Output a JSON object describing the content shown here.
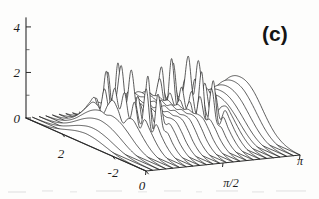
{
  "figure": {
    "panel_label": "(c)",
    "type": "3d-waterfall-ridge-plot",
    "ink_color": "#1c1c1c",
    "background_color": "#fdfdfc"
  },
  "axes": {
    "z_axis": {
      "name": "vertical-amplitude-axis",
      "ticks": [
        {
          "label": "0",
          "value": 0
        },
        {
          "label": "2",
          "value": 2
        },
        {
          "label": "4",
          "value": 4
        }
      ],
      "minor_ticks": [
        1,
        3
      ],
      "range": [
        0,
        4.4
      ]
    },
    "depth_axis": {
      "name": "left-depth-axis",
      "ticks": [
        {
          "label": "2",
          "value": 2
        },
        {
          "label": "-2",
          "value": -2
        },
        {
          "label": "0",
          "value": 0
        }
      ],
      "range": [
        4,
        -4
      ]
    },
    "time_axis": {
      "name": "bottom-right-phase-axis",
      "ticks": [
        {
          "label": "0",
          "value": 0
        },
        {
          "label": "π/2",
          "value": 1.5708
        },
        {
          "label": "π",
          "value": 3.1416
        }
      ],
      "range": [
        0,
        3.1416
      ]
    }
  },
  "chart_data": {
    "type": "line",
    "title": "",
    "subtitle": "",
    "xlabel": "",
    "ylabel": "",
    "zlabel": "",
    "grid": false,
    "legend": "none",
    "projection": {
      "origin_x": 26,
      "origin_y": 118,
      "x_unit_px": 88.0,
      "y_depth_dx": 30.0,
      "y_depth_dy": -27.0,
      "z_unit_px": 24.6
    },
    "xlim": [
      0,
      3.1416
    ],
    "ylim": [
      -4,
      4
    ],
    "zlim": [
      0,
      4.4
    ],
    "note": "Waterfall of 24 successive ridge traces; each trace is an oscillatory packet amplitude vs. a transverse coordinate, stacked along the phase axis.",
    "x": [
      -4.0,
      -3.6667,
      -3.3333,
      -3.0,
      -2.6667,
      -2.3333,
      -2.0,
      -1.6667,
      -1.3333,
      -1.0,
      -0.6667,
      -0.3333,
      0.0,
      0.3333,
      0.6667,
      1.0,
      1.3333,
      1.6667,
      2.0,
      2.3333,
      2.6667,
      3.0,
      3.3333,
      3.6667,
      4.0
    ],
    "series": [
      {
        "name": "trace-01",
        "phase": 0.0,
        "values": [
          0.0,
          0.0,
          0.01,
          0.02,
          0.04,
          0.07,
          0.12,
          0.18,
          0.25,
          0.32,
          0.38,
          0.42,
          0.44,
          0.42,
          0.38,
          0.32,
          0.25,
          0.18,
          0.12,
          0.07,
          0.04,
          0.02,
          0.01,
          0.0,
          0.0
        ]
      },
      {
        "name": "trace-02",
        "phase": 0.1368,
        "values": [
          0.0,
          0.01,
          0.02,
          0.04,
          0.07,
          0.12,
          0.19,
          0.28,
          0.38,
          0.48,
          0.56,
          0.62,
          0.64,
          0.62,
          0.56,
          0.48,
          0.38,
          0.28,
          0.19,
          0.12,
          0.07,
          0.04,
          0.02,
          0.01,
          0.0
        ]
      },
      {
        "name": "trace-03",
        "phase": 0.2736,
        "values": [
          0.0,
          0.01,
          0.03,
          0.06,
          0.11,
          0.19,
          0.3,
          0.44,
          0.59,
          0.73,
          0.84,
          0.91,
          0.94,
          0.91,
          0.84,
          0.73,
          0.59,
          0.44,
          0.3,
          0.19,
          0.11,
          0.06,
          0.03,
          0.01,
          0.0
        ]
      },
      {
        "name": "trace-04",
        "phase": 0.4104,
        "values": [
          0.0,
          0.02,
          0.05,
          0.1,
          0.18,
          0.3,
          0.46,
          0.66,
          0.86,
          1.03,
          1.14,
          1.18,
          1.12,
          1.18,
          1.14,
          1.03,
          0.86,
          0.66,
          0.46,
          0.3,
          0.18,
          0.1,
          0.05,
          0.02,
          0.0
        ]
      },
      {
        "name": "trace-05",
        "phase": 0.5472,
        "values": [
          0.01,
          0.03,
          0.07,
          0.15,
          0.28,
          0.47,
          0.72,
          1.0,
          1.25,
          1.2,
          0.95,
          1.4,
          1.68,
          1.4,
          0.95,
          1.2,
          1.25,
          1.0,
          0.72,
          0.47,
          0.28,
          0.15,
          0.07,
          0.03,
          0.01
        ]
      },
      {
        "name": "trace-06",
        "phase": 0.684,
        "values": [
          0.01,
          0.04,
          0.1,
          0.21,
          0.4,
          0.68,
          1.02,
          1.32,
          0.9,
          1.85,
          1.1,
          2.05,
          1.3,
          2.05,
          1.1,
          1.85,
          0.9,
          1.32,
          1.02,
          0.68,
          0.4,
          0.21,
          0.1,
          0.04,
          0.01
        ]
      },
      {
        "name": "trace-07",
        "phase": 0.8208,
        "values": [
          0.01,
          0.05,
          0.13,
          0.27,
          0.5,
          0.82,
          1.18,
          0.85,
          2.45,
          0.95,
          1.6,
          2.95,
          1.55,
          2.95,
          1.6,
          0.95,
          2.45,
          0.85,
          1.18,
          0.82,
          0.5,
          0.27,
          0.13,
          0.05,
          0.01
        ]
      },
      {
        "name": "trace-08",
        "phase": 0.9576,
        "values": [
          0.01,
          0.05,
          0.14,
          0.29,
          0.54,
          0.88,
          1.05,
          2.3,
          0.8,
          2.85,
          1.0,
          1.85,
          1.0,
          1.85,
          1.0,
          2.85,
          0.8,
          2.3,
          1.05,
          0.88,
          0.54,
          0.29,
          0.14,
          0.05,
          0.01
        ]
      },
      {
        "name": "trace-09",
        "phase": 1.0944,
        "values": [
          0.01,
          0.05,
          0.14,
          0.3,
          0.55,
          0.9,
          1.15,
          1.1,
          1.95,
          0.95,
          1.55,
          1.05,
          1.45,
          1.05,
          1.55,
          0.95,
          1.95,
          1.1,
          1.15,
          0.9,
          0.55,
          0.3,
          0.14,
          0.05,
          0.01
        ]
      },
      {
        "name": "trace-10",
        "phase": 1.2312,
        "values": [
          0.01,
          0.05,
          0.14,
          0.3,
          0.55,
          0.9,
          1.18,
          1.25,
          1.22,
          1.28,
          1.2,
          1.3,
          1.18,
          1.3,
          1.2,
          1.28,
          1.22,
          1.25,
          1.18,
          0.9,
          0.55,
          0.3,
          0.14,
          0.05,
          0.01
        ]
      },
      {
        "name": "trace-11",
        "phase": 1.368,
        "values": [
          0.01,
          0.05,
          0.14,
          0.3,
          0.56,
          0.92,
          1.22,
          1.3,
          1.26,
          1.32,
          1.24,
          1.33,
          1.22,
          1.33,
          1.24,
          1.32,
          1.26,
          1.3,
          1.22,
          0.92,
          0.56,
          0.3,
          0.14,
          0.05,
          0.01
        ]
      },
      {
        "name": "trace-12",
        "phase": 1.5048,
        "values": [
          0.01,
          0.05,
          0.15,
          0.31,
          0.57,
          0.94,
          1.24,
          1.32,
          1.28,
          1.34,
          1.26,
          1.35,
          1.24,
          1.35,
          1.26,
          1.34,
          1.28,
          1.32,
          1.24,
          0.94,
          0.57,
          0.31,
          0.15,
          0.05,
          0.01
        ]
      },
      {
        "name": "trace-13",
        "phase": 1.6416,
        "values": [
          0.01,
          0.05,
          0.15,
          0.31,
          0.57,
          0.94,
          1.25,
          1.33,
          1.29,
          1.35,
          1.27,
          1.36,
          1.25,
          1.36,
          1.27,
          1.35,
          1.29,
          1.33,
          1.25,
          0.94,
          0.57,
          0.31,
          0.15,
          0.05,
          0.01
        ]
      },
      {
        "name": "trace-14",
        "phase": 1.7784,
        "values": [
          0.01,
          0.05,
          0.14,
          0.3,
          0.56,
          0.92,
          1.22,
          1.3,
          1.27,
          1.33,
          1.25,
          1.34,
          1.23,
          1.34,
          1.25,
          1.33,
          1.27,
          1.3,
          1.22,
          0.92,
          0.56,
          0.3,
          0.14,
          0.05,
          0.01
        ]
      },
      {
        "name": "trace-15",
        "phase": 1.9152,
        "values": [
          0.01,
          0.05,
          0.14,
          0.3,
          0.55,
          0.9,
          1.16,
          1.12,
          1.92,
          0.96,
          1.52,
          1.08,
          1.42,
          1.08,
          1.52,
          0.96,
          1.92,
          1.12,
          1.16,
          0.9,
          0.55,
          0.3,
          0.14,
          0.05,
          0.01
        ]
      },
      {
        "name": "trace-16",
        "phase": 2.052,
        "values": [
          0.01,
          0.05,
          0.14,
          0.29,
          0.54,
          0.88,
          1.06,
          2.28,
          0.82,
          2.8,
          1.02,
          1.82,
          1.02,
          1.82,
          1.02,
          2.8,
          0.82,
          2.28,
          1.06,
          0.88,
          0.54,
          0.29,
          0.14,
          0.05,
          0.01
        ]
      },
      {
        "name": "trace-17",
        "phase": 2.1888,
        "values": [
          0.01,
          0.05,
          0.13,
          0.27,
          0.51,
          0.83,
          1.2,
          0.88,
          2.5,
          0.98,
          1.62,
          3.05,
          1.58,
          3.05,
          1.62,
          0.98,
          2.5,
          0.88,
          1.2,
          0.83,
          0.51,
          0.27,
          0.13,
          0.05,
          0.01
        ]
      },
      {
        "name": "trace-18",
        "phase": 2.3256,
        "values": [
          0.01,
          0.04,
          0.1,
          0.22,
          0.42,
          0.7,
          1.05,
          1.35,
          0.92,
          1.9,
          1.12,
          2.1,
          1.32,
          2.1,
          1.12,
          1.9,
          0.92,
          1.35,
          1.05,
          0.7,
          0.42,
          0.22,
          0.1,
          0.04,
          0.01
        ]
      },
      {
        "name": "trace-19",
        "phase": 2.4624,
        "values": [
          0.01,
          0.03,
          0.08,
          0.17,
          0.32,
          0.54,
          0.82,
          1.12,
          1.38,
          1.3,
          1.05,
          1.52,
          1.78,
          1.52,
          1.05,
          1.3,
          1.38,
          1.12,
          0.82,
          0.54,
          0.32,
          0.17,
          0.08,
          0.03,
          0.01
        ]
      },
      {
        "name": "trace-20",
        "phase": 2.5992,
        "values": [
          0.0,
          0.02,
          0.06,
          0.13,
          0.24,
          0.41,
          0.63,
          0.88,
          1.12,
          1.32,
          1.45,
          1.52,
          1.5,
          1.52,
          1.45,
          1.32,
          1.12,
          0.88,
          0.63,
          0.41,
          0.24,
          0.13,
          0.06,
          0.02,
          0.0
        ]
      },
      {
        "name": "trace-21",
        "phase": 2.736,
        "values": [
          0.0,
          0.02,
          0.05,
          0.11,
          0.21,
          0.36,
          0.57,
          0.82,
          1.08,
          1.32,
          1.5,
          1.6,
          1.63,
          1.6,
          1.5,
          1.32,
          1.08,
          0.82,
          0.57,
          0.36,
          0.21,
          0.11,
          0.05,
          0.02,
          0.0
        ]
      },
      {
        "name": "trace-22",
        "phase": 2.8728,
        "values": [
          0.0,
          0.02,
          0.05,
          0.11,
          0.21,
          0.37,
          0.59,
          0.86,
          1.15,
          1.42,
          1.62,
          1.74,
          1.78,
          1.74,
          1.62,
          1.42,
          1.15,
          0.86,
          0.59,
          0.37,
          0.21,
          0.11,
          0.05,
          0.02,
          0.0
        ]
      },
      {
        "name": "trace-23",
        "phase": 3.0096,
        "values": [
          0.0,
          0.02,
          0.05,
          0.12,
          0.23,
          0.4,
          0.64,
          0.94,
          1.26,
          1.55,
          1.78,
          1.91,
          1.95,
          1.91,
          1.78,
          1.55,
          1.26,
          0.94,
          0.64,
          0.4,
          0.23,
          0.12,
          0.05,
          0.02,
          0.0
        ]
      },
      {
        "name": "trace-24",
        "phase": 3.1416,
        "values": [
          0.0,
          0.02,
          0.06,
          0.13,
          0.25,
          0.43,
          0.69,
          1.01,
          1.36,
          1.68,
          1.92,
          2.06,
          2.1,
          2.06,
          1.92,
          1.68,
          1.36,
          1.01,
          0.69,
          0.43,
          0.25,
          0.13,
          0.06,
          0.02,
          0.0
        ]
      }
    ]
  }
}
